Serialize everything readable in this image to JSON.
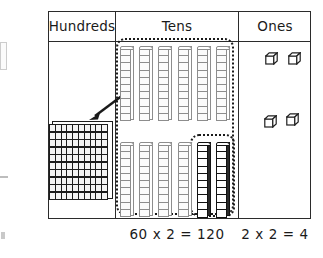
{
  "chart_data": {
    "type": "table",
    "columns": [
      "Hundreds",
      "Tens",
      "Ones"
    ],
    "cells": {
      "hundreds": {
        "blocks": "hundreds-flat",
        "count": 1,
        "units": 100,
        "grid_rows": 10,
        "grid_cols": 10
      },
      "tens": {
        "blocks": "ten-rods",
        "count": 12,
        "light_rods": 10,
        "dark_rods": 2,
        "units_per_rod": 10,
        "rows": [
          6,
          6
        ]
      },
      "ones": {
        "blocks": "unit-cubes",
        "count": 4,
        "rows": [
          2,
          2
        ]
      }
    },
    "annotations": [
      {
        "type": "dotted-group",
        "target": "tens",
        "note": "groups all twelve ten-rods"
      },
      {
        "type": "dotted-group",
        "target": "tens-dark",
        "note": "groups the two dark ten-rods"
      },
      {
        "type": "arrow",
        "from": "tens",
        "to": "hundreds",
        "note": "regroup ten tens into one hundred"
      }
    ],
    "equations": [
      "60 x 2 = 120",
      "2 x 2 = 4"
    ]
  },
  "header": {
    "hundreds": "Hundreds",
    "tens": "Tens",
    "ones": "Ones"
  },
  "footer": {
    "tens_equation": "60 x 2 = 120",
    "ones_equation": "2 x 2 = 4"
  },
  "colors": {
    "ink": "#1a1a1a",
    "rule": "#2b2b2b",
    "block_light": "#fbfbfb",
    "block_outline": "#8d8d8d",
    "block_dark": "#121212",
    "flat_fill": "#f4f4f4"
  }
}
